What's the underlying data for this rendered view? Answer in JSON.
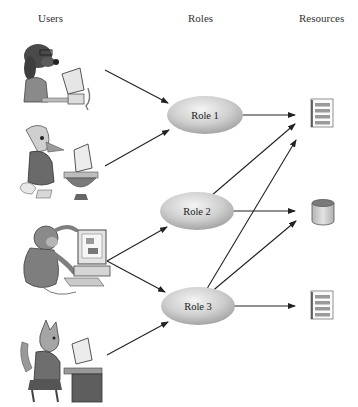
{
  "headers": {
    "users": "Users",
    "roles": "Roles",
    "resources": "Resources"
  },
  "users": [
    {
      "id": "user-1",
      "icon": "dog-at-computer-icon"
    },
    {
      "id": "user-2",
      "icon": "duck-at-computer-icon"
    },
    {
      "id": "user-3",
      "icon": "monkey-at-computer-icon"
    },
    {
      "id": "user-4",
      "icon": "cat-at-computer-icon"
    }
  ],
  "roles": [
    {
      "id": "role-1",
      "label": "Role 1"
    },
    {
      "id": "role-2",
      "label": "Role 2"
    },
    {
      "id": "role-3",
      "label": "Role 3"
    }
  ],
  "resources": [
    {
      "id": "resource-1",
      "icon": "document-icon"
    },
    {
      "id": "resource-2",
      "icon": "database-icon"
    },
    {
      "id": "resource-3",
      "icon": "document-icon"
    }
  ],
  "edges": [
    {
      "from": "user-1",
      "to": "role-1"
    },
    {
      "from": "user-2",
      "to": "role-1"
    },
    {
      "from": "user-3",
      "to": "role-2"
    },
    {
      "from": "user-3",
      "to": "role-3"
    },
    {
      "from": "user-4",
      "to": "role-3"
    },
    {
      "from": "role-1",
      "to": "resource-1"
    },
    {
      "from": "role-2",
      "to": "resource-1"
    },
    {
      "from": "role-2",
      "to": "resource-2"
    },
    {
      "from": "role-3",
      "to": "resource-1"
    },
    {
      "from": "role-3",
      "to": "resource-2"
    },
    {
      "from": "role-3",
      "to": "resource-3"
    }
  ],
  "colors": {
    "role_fill_light": "#f2f2f2",
    "role_fill_dark": "#a8a8a8",
    "arrow": "#222222",
    "doc_lines": "#9a9a9a",
    "db_fill": "#c8c8c8"
  }
}
